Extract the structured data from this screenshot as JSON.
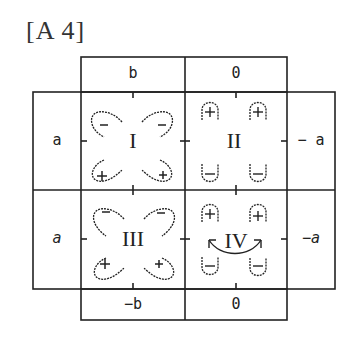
{
  "title": "[A 4]",
  "columns": {
    "top": [
      "b",
      "0"
    ],
    "bottom": [
      "−b",
      "0"
    ]
  },
  "rows": {
    "left": [
      "a",
      "a"
    ],
    "right": [
      "− a",
      "−a"
    ]
  },
  "quadrants": [
    {
      "label": "I",
      "top_charges": [
        "−",
        "−"
      ],
      "bottom_charges": [
        "+",
        "+"
      ],
      "shape": "diagonal-loops"
    },
    {
      "label": "II",
      "top_charges": [
        "+",
        "+"
      ],
      "bottom_charges": [
        "−",
        "−"
      ],
      "shape": "vertical-loops"
    },
    {
      "label": "III",
      "top_charges": [
        "−",
        "−"
      ],
      "bottom_charges": [
        "+",
        "+"
      ],
      "shape": "diagonal-loops"
    },
    {
      "label": "IV",
      "top_charges": [
        "+",
        "+"
      ],
      "bottom_charges": [
        "−",
        "−"
      ],
      "shape": "vertical-loops-with-arrows"
    }
  ],
  "colors": {
    "line": "#222222",
    "background": "#ffffff"
  }
}
